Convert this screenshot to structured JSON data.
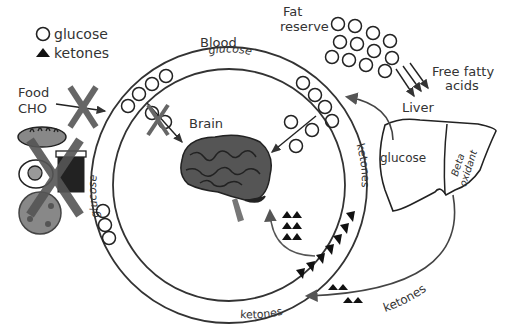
{
  "legend": {
    "glucose_label": "glucose",
    "ketones_label": "ketones"
  },
  "labels": {
    "blood": "Blood",
    "fat_reserve_line1": "Fat",
    "fat_reserve_line2": "reserve",
    "free_fatty_acids_line1": "Free fatty",
    "free_fatty_acids_line2": "acids",
    "liver": "Liver",
    "liver_glucose": "glucose",
    "beta_oxidant_line1": "Beta",
    "beta_oxidant_line2": "oxidant",
    "food_line1": "Food",
    "food_line2": "CHO",
    "brain": "Brain",
    "ring_glucose_top": "glucose",
    "ring_glucose_left": "glucose",
    "ring_ketones_right": "ketones",
    "ring_ketones_bottom": "ketones",
    "outer_ketones": "ketones"
  },
  "colors": {
    "line": "#333333",
    "brain": "#555555",
    "cross": "#555555",
    "ketone": "#111111"
  }
}
